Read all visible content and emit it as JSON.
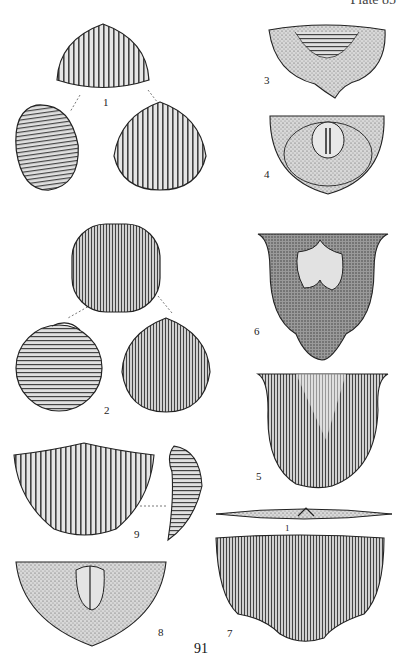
{
  "plate": {
    "header": "Plate 85",
    "page_number": "91"
  },
  "figures": [
    {
      "number": "1",
      "description": "Shell, three views (dorsal-posterior, lateral, ventral), strongly ribbed"
    },
    {
      "number": "2",
      "description": "Globose shell, three views, fine ribbing"
    },
    {
      "number": "3",
      "description": "Valve exterior with concentric rugae"
    },
    {
      "number": "4",
      "description": "Valve interior showing muscle scars"
    },
    {
      "number": "5",
      "description": "Valve exterior, finely costellate"
    },
    {
      "number": "6",
      "description": "Valve interior with muscle field"
    },
    {
      "number": "7",
      "description": "Flat valve exterior with radial costellae and hinge-line profile view"
    },
    {
      "number": "8",
      "description": "Valve interior, semicircular, with median septum"
    },
    {
      "number": "9",
      "description": "Alate valve, exterior and lateral profile"
    }
  ],
  "labels": {
    "fig1": "1",
    "fig2": "2",
    "fig3": "3",
    "fig4": "4",
    "fig5": "5",
    "fig6": "6",
    "fig7": "7",
    "fig7_small": "1",
    "fig8": "8",
    "fig9": "9"
  }
}
